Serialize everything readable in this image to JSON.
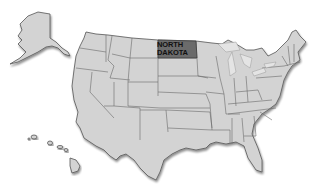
{
  "map": {
    "title": "United States",
    "highlighted_state": {
      "name": "North Dakota",
      "label_lines": [
        "NORTH",
        "DAKOTA"
      ],
      "fill_color": "#6b6b6b"
    },
    "colors": {
      "background": "#ffffff",
      "state_fill": "#cfcfcf",
      "state_border": "#6a6a6a"
    },
    "regions_shown": [
      "Contiguous United States",
      "Alaska",
      "Hawaii"
    ]
  }
}
